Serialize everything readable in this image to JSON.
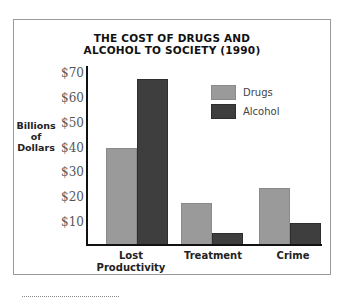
{
  "chart_data": {
    "type": "bar",
    "title": "THE COST OF DRUGS AND ALCOHOL TO SOCIETY (1990)",
    "title_lines": [
      "THE COST OF DRUGS AND",
      "ALCOHOL TO SOCIETY (1990)"
    ],
    "xlabel": "",
    "ylabel": "Billions of Dollars",
    "ylabel_lines": [
      "Billions",
      "of",
      "Dollars"
    ],
    "categories": [
      "Lost Productivity",
      "Treatment",
      "Crime"
    ],
    "category_lines": [
      [
        "Lost",
        "Productivity"
      ],
      [
        "Treatment"
      ],
      [
        "Crime"
      ]
    ],
    "series": [
      {
        "name": "Drugs",
        "color": "#9a9a9a",
        "values": [
          39,
          17,
          23
        ]
      },
      {
        "name": "Alcohol",
        "color": "#3e3e3e",
        "values": [
          67,
          5,
          9
        ]
      }
    ],
    "yticks": [
      "$10",
      "$20",
      "$30",
      "$40",
      "$50",
      "$60",
      "$70"
    ],
    "ylim": [
      0,
      70
    ],
    "grid": false,
    "legend_position": "upper right"
  }
}
